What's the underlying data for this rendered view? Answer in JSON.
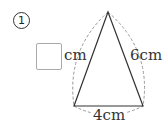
{
  "problem": {
    "number": "1",
    "answer_box": "",
    "unknown_side_unit": "cm",
    "right_side_label": "6cm",
    "base_label": "4cm"
  },
  "figure": {
    "shape": "isosceles-triangle",
    "apex": [
      108,
      12
    ],
    "base_left": [
      74,
      106
    ],
    "base_right": [
      143,
      106
    ],
    "line_color": "#333333",
    "dashed_arc_color": "#999999"
  }
}
